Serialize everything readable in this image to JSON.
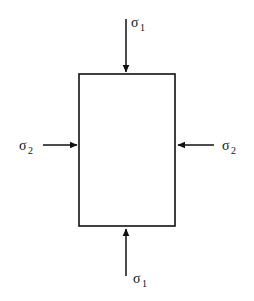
{
  "figure": {
    "background_color": "#ffffff",
    "line_color": "#111111",
    "text_color": "#111111"
  },
  "element": {
    "shape": "rectangle",
    "x": 79,
    "y": 74,
    "width": 96,
    "height": 152,
    "stroke_width": 1.6,
    "fill": "none"
  },
  "loads": [
    {
      "id": "top",
      "symbol": "σ",
      "subscript": "1",
      "label": "σ₁",
      "direction": "down",
      "sense": "compression",
      "shaft": {
        "x1": 126,
        "y1": 19,
        "x2": 126,
        "y2": 72
      },
      "label_pos": {
        "x": 131,
        "y": 27
      },
      "sub_pos": {
        "x": 140,
        "y": 31
      }
    },
    {
      "id": "left",
      "symbol": "σ",
      "subscript": "2",
      "label": "σ₂",
      "direction": "right",
      "sense": "compression",
      "shaft": {
        "x1": 43,
        "y1": 145,
        "x2": 77,
        "y2": 145
      },
      "label_pos": {
        "x": 19,
        "y": 150
      },
      "sub_pos": {
        "x": 28,
        "y": 154
      }
    },
    {
      "id": "right",
      "symbol": "σ",
      "subscript": "2",
      "label": "σ₂",
      "direction": "left",
      "sense": "compression",
      "shaft": {
        "x1": 214,
        "y1": 145,
        "x2": 178,
        "y2": 145
      },
      "label_pos": {
        "x": 222,
        "y": 150
      },
      "sub_pos": {
        "x": 231,
        "y": 154
      }
    },
    {
      "id": "bottom",
      "symbol": "σ",
      "subscript": "1",
      "label": "σ₁",
      "direction": "up",
      "sense": "compression",
      "shaft": {
        "x1": 126,
        "y1": 276,
        "x2": 126,
        "y2": 229
      },
      "label_pos": {
        "x": 133,
        "y": 283
      },
      "sub_pos": {
        "x": 142,
        "y": 287
      }
    }
  ]
}
